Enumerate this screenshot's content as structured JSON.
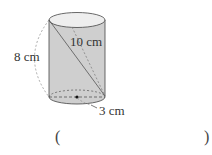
{
  "diagram": {
    "shape": "cylinder",
    "labels": {
      "height": "8 cm",
      "diagonal": "10 cm",
      "radius": "3 cm"
    },
    "answer_blank": {
      "open": "(",
      "close": ")"
    },
    "colors": {
      "body_fill": "#cfcfcf",
      "top_fill": "#eeeeee",
      "stroke": "#444444",
      "dashed": "#888888"
    }
  }
}
